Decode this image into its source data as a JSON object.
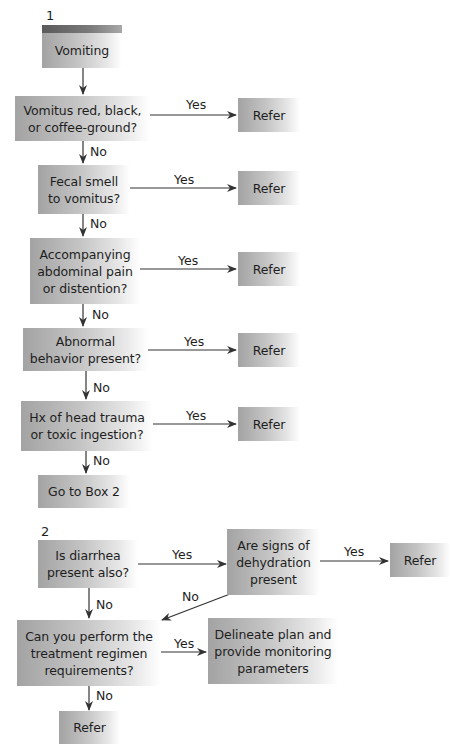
{
  "flowchart": {
    "box1": {
      "number": "1",
      "start": "Vomiting",
      "q1": "Vomitus red, black,\nor coffee-ground?",
      "q2": "Fecal smell\nto vomitus?",
      "q3": "Accompanying\nabdominal pain\nor distention?",
      "q4": "Abnormal\nbehavior present?",
      "q5": "Hx of head trauma\nor toxic ingestion?",
      "goto": "Go to Box 2",
      "refer1": "Refer",
      "refer2": "Refer",
      "refer3": "Refer",
      "refer4": "Refer",
      "refer5": "Refer"
    },
    "box2": {
      "number": "2",
      "q1": "Is diarrhea\npresent also?",
      "q2": "Are signs of\ndehydration\npresent",
      "q3": "Can you perform the\ntreatment regimen\nrequirements?",
      "plan": "Delineate plan and\nprovide monitoring\nparameters",
      "refer1": "Refer",
      "refer2": "Refer"
    },
    "labels": {
      "yes": "Yes",
      "no": "No"
    },
    "colors": {
      "box_gradient_start": "#a3a3a3",
      "box_gradient_end": "#ffffff",
      "band_dark": "#5a5a5a",
      "line": "#333333"
    }
  }
}
